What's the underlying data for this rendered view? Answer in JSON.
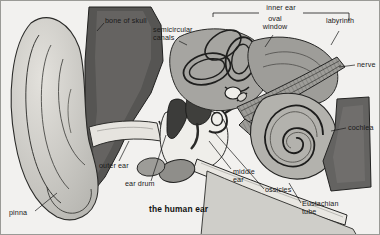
{
  "figure": {
    "title": "the human ear",
    "medium": "grayscale anatomical cross-section illustration",
    "background_color": "#f2f1ef",
    "border_color": "#9a9a96",
    "ink_color": "#1a1a1a"
  },
  "palette": {
    "skull_bone_dark": "#4a4a49",
    "bone_mid": "#8d8d8a",
    "tissue_light": "#c9c8c4",
    "cavity_white": "#f4f3f0",
    "cartilage": "#b4b3ae",
    "canal_light": "#dedcd7",
    "ossicle_dark": "#3f3f3e",
    "nerve_gray": "#7e7d7a"
  },
  "labels": [
    {
      "id": "bone-of-skull",
      "text": "bone of skull",
      "x": 104,
      "y": 20,
      "align": "left"
    },
    {
      "id": "semicircular-canals",
      "text": "semicircular\ncanals",
      "x": 152,
      "y": 29,
      "align": "left"
    },
    {
      "id": "inner-ear",
      "text": "inner ear",
      "x": 280,
      "y": 7,
      "align": "center"
    },
    {
      "id": "oval-window",
      "text": "oval\nwindow",
      "x": 274,
      "y": 18,
      "align": "center"
    },
    {
      "id": "labyrinth",
      "text": "labyrinth",
      "x": 338,
      "y": 20,
      "align": "center"
    },
    {
      "id": "nerve",
      "text": "nerve",
      "x": 355,
      "y": 63,
      "align": "left"
    },
    {
      "id": "cochlea",
      "text": "cochlea",
      "x": 346,
      "y": 126,
      "align": "left"
    },
    {
      "id": "outer-ear",
      "text": "outer ear",
      "x": 98,
      "y": 165,
      "align": "left"
    },
    {
      "id": "ear-drum",
      "text": "ear drum",
      "x": 124,
      "y": 183,
      "align": "left"
    },
    {
      "id": "middle-ear",
      "text": "middle\near",
      "x": 232,
      "y": 170,
      "align": "left"
    },
    {
      "id": "ossicles",
      "text": "ossicles",
      "x": 264,
      "y": 189,
      "align": "left"
    },
    {
      "id": "eustachian-tube",
      "text": "Eustachian\ntube",
      "x": 300,
      "y": 203,
      "align": "left"
    },
    {
      "id": "pinna",
      "text": "pinna",
      "x": 8,
      "y": 212,
      "align": "left"
    }
  ],
  "anatomy_parts": [
    "pinna",
    "outer ear",
    "ear drum",
    "middle ear",
    "ossicles",
    "Eustachian tube",
    "semicircular canals",
    "oval window",
    "labyrinth",
    "cochlea",
    "nerve",
    "bone of skull",
    "inner ear"
  ]
}
